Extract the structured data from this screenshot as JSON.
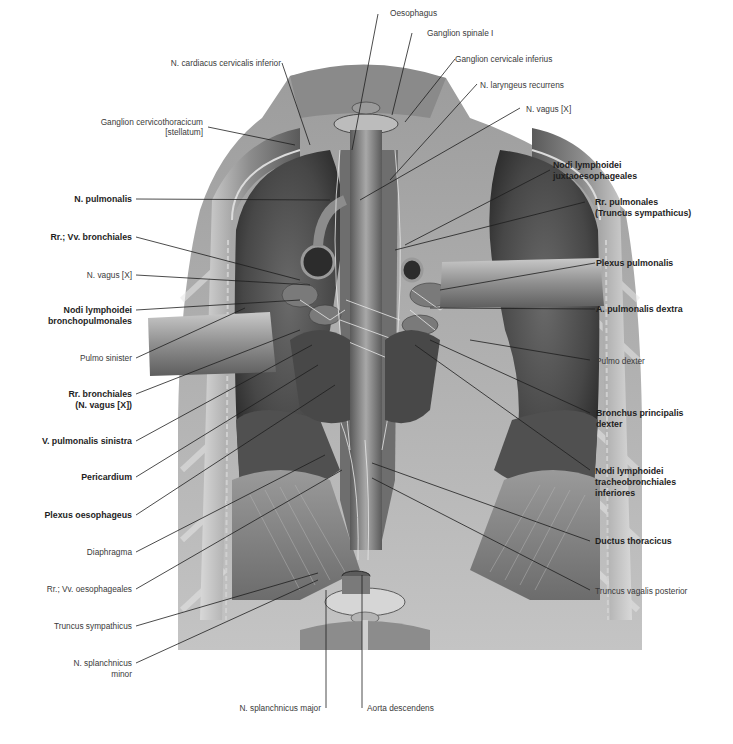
{
  "figure": {
    "type": "anatomical illustration",
    "colors": {
      "background": "#ffffff",
      "tissue_dark": "#3c3c3c",
      "tissue_mid": "#7a7a7a",
      "tissue_light": "#bdbdbd",
      "label_text": "#2a2a2a",
      "leader_line": "#222222"
    }
  },
  "labels": {
    "top": [
      {
        "id": "n-cardiacus",
        "text": "N. cardiacus cervicalis inferior",
        "bold": false
      },
      {
        "id": "oesophagus",
        "text": "Oesophagus",
        "bold": false
      },
      {
        "id": "ganglion-spinale",
        "text": "Ganglion spinale I",
        "bold": false
      },
      {
        "id": "ganglion-cervicale",
        "text": "Ganglion cervicale inferius",
        "bold": false
      },
      {
        "id": "n-laryngeus",
        "text": "N. laryngeus recurrens",
        "bold": false
      },
      {
        "id": "n-vagus-right",
        "text": "N. vagus [X]",
        "bold": false
      },
      {
        "id": "ganglion-stellatum-1",
        "text": "Ganglion cervicothoracicum",
        "bold": false
      },
      {
        "id": "ganglion-stellatum-2",
        "text": "[stellatum]",
        "bold": false
      }
    ],
    "left": [
      {
        "id": "n-pulmonalis",
        "text": "N. pulmonalis",
        "bold": true
      },
      {
        "id": "rr-vv-bronchiales",
        "text": "Rr.; Vv. bronchiales",
        "bold": true
      },
      {
        "id": "n-vagus-left",
        "text": "N. vagus [X]",
        "bold": false
      },
      {
        "id": "nodi-broncho-1",
        "text": "Nodi lymphoidei",
        "bold": true
      },
      {
        "id": "nodi-broncho-2",
        "text": "bronchopulmonales",
        "bold": true
      },
      {
        "id": "pulmo-sinister",
        "text": "Pulmo sinister",
        "bold": false
      },
      {
        "id": "rr-bronchiales-1",
        "text": "Rr. bronchiales",
        "bold": true
      },
      {
        "id": "rr-bronchiales-2",
        "text": "(N. vagus [X])",
        "bold": true
      },
      {
        "id": "v-pulmonalis",
        "text": "V. pulmonalis sinistra",
        "bold": true
      },
      {
        "id": "pericardium",
        "text": "Pericardium",
        "bold": true
      },
      {
        "id": "plexus-oesophageus",
        "text": "Plexus oesophageus",
        "bold": true
      },
      {
        "id": "diaphragma",
        "text": "Diaphragma",
        "bold": false
      },
      {
        "id": "rr-vv-oesophageales",
        "text": "Rr.; Vv. oesophageales",
        "bold": false
      },
      {
        "id": "truncus-sympathicus",
        "text": "Truncus sympathicus",
        "bold": false
      },
      {
        "id": "n-splanchnicus-minor-1",
        "text": "N. splanchnicus",
        "bold": false
      },
      {
        "id": "n-splanchnicus-minor-2",
        "text": "minor",
        "bold": false
      }
    ],
    "right": [
      {
        "id": "nodi-juxta-1",
        "text": "Nodi lymphoidei",
        "bold": true
      },
      {
        "id": "nodi-juxta-2",
        "text": "juxtaoesophageales",
        "bold": true
      },
      {
        "id": "rr-pulmonales-1",
        "text": "Rr. pulmonales",
        "bold": true
      },
      {
        "id": "rr-pulmonales-2",
        "text": "(Truncus sympathicus)",
        "bold": true
      },
      {
        "id": "plexus-pulmonalis",
        "text": "Plexus pulmonalis",
        "bold": true
      },
      {
        "id": "a-pulmonalis",
        "text": "A. pulmonalis dextra",
        "bold": true
      },
      {
        "id": "pulmo-dexter",
        "text": "Pulmo dexter",
        "bold": false
      },
      {
        "id": "bronchus-1",
        "text": "Bronchus principalis",
        "bold": true
      },
      {
        "id": "bronchus-2",
        "text": "dexter",
        "bold": true
      },
      {
        "id": "nodi-tracheo-1",
        "text": "Nodi lymphoidei",
        "bold": true
      },
      {
        "id": "nodi-tracheo-2",
        "text": "tracheobronchiales",
        "bold": true
      },
      {
        "id": "nodi-tracheo-3",
        "text": "inferiores",
        "bold": true
      },
      {
        "id": "ductus-thoracicus",
        "text": "Ductus thoracicus",
        "bold": true
      },
      {
        "id": "truncus-vagalis",
        "text": "Truncus vagalis posterior",
        "bold": false
      }
    ],
    "bottom": [
      {
        "id": "n-splanchnicus-major",
        "text": "N. splanchnicus major",
        "bold": false
      },
      {
        "id": "aorta-descendens",
        "text": "Aorta descendens",
        "bold": false
      }
    ]
  }
}
